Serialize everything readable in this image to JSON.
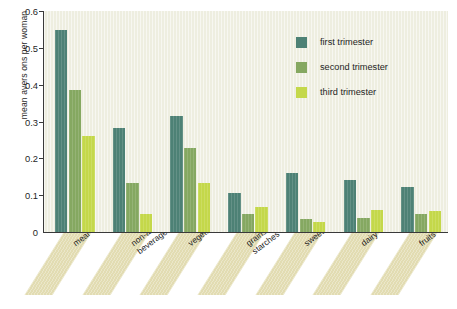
{
  "chart_data": {
    "type": "bar",
    "title": "",
    "subtitle": "",
    "xlabel": "",
    "ylabel": "mean avers ons per woman",
    "ylim": [
      0,
      0.6
    ],
    "yticks": [
      0,
      0.1,
      0.2,
      0.3,
      0.4,
      0.5,
      0.6
    ],
    "ytick_labels": [
      "0",
      "0.1",
      "0.2",
      "0.3",
      "0.4",
      "0.5",
      "0.6"
    ],
    "grid": false,
    "legend_position": "upper right",
    "categories": [
      "meal",
      "non-alcoholic beverages",
      "vegetables",
      "grains and starches",
      "sweets",
      "dairy",
      "fruits"
    ],
    "series": [
      {
        "name": "first trimester",
        "color": "#4d8175",
        "values": [
          0.548,
          0.283,
          0.315,
          0.105,
          0.16,
          0.14,
          0.122
        ]
      },
      {
        "name": "second trimester",
        "color": "#85a861",
        "values": [
          0.385,
          0.133,
          0.228,
          0.048,
          0.034,
          0.038,
          0.05
        ]
      },
      {
        "name": "third trimester",
        "color": "#c4d84a",
        "values": [
          0.262,
          0.05,
          0.134,
          0.068,
          0.028,
          0.06,
          0.058
        ]
      }
    ],
    "annotations": [],
    "plot_background": "#eeeee0",
    "axis_color": "#3a3a3a",
    "category_band_color": "#e2dcb2"
  },
  "legend": {
    "items": [
      {
        "label": "first trimester"
      },
      {
        "label": "second trimester"
      },
      {
        "label": "third trimester"
      }
    ]
  },
  "caption": {
    "text": ""
  }
}
